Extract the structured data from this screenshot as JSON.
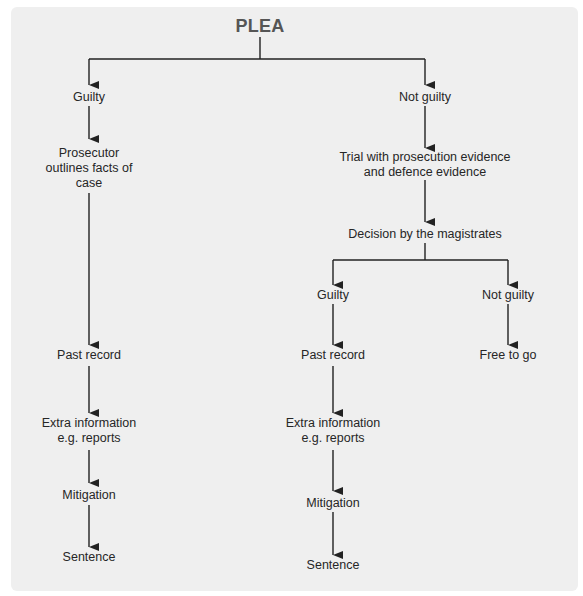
{
  "diagram": {
    "root": "PLEA",
    "branches": {
      "guilty_plea": {
        "label": "Guilty",
        "steps": [
          [
            "Prosecutor",
            "outlines facts of",
            "case"
          ],
          [
            "Past record"
          ],
          [
            "Extra information",
            "e.g. reports"
          ],
          [
            "Mitigation"
          ],
          [
            "Sentence"
          ]
        ]
      },
      "not_guilty_plea": {
        "label": "Not guilty",
        "trial": [
          "Trial with prosecution evidence",
          "and defence evidence"
        ],
        "decision": "Decision by the magistrates",
        "outcomes": {
          "guilty": {
            "label": "Guilty",
            "steps": [
              [
                "Past record"
              ],
              [
                "Extra information",
                "e.g. reports"
              ],
              [
                "Mitigation"
              ],
              [
                "Sentence"
              ]
            ]
          },
          "not_guilty": {
            "label": "Not guilty",
            "steps": [
              [
                "Free to go"
              ]
            ]
          }
        }
      }
    }
  },
  "colors": {
    "background": "#efefef",
    "line": "#222222",
    "title": "#555555",
    "text": "#262626"
  }
}
